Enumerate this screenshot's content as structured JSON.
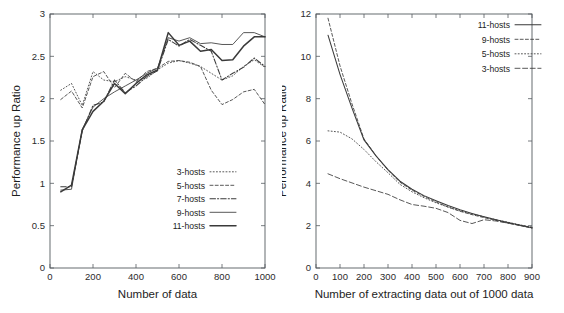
{
  "figure": {
    "panels": [
      "left",
      "right"
    ]
  },
  "chart_data": [
    {
      "id": "left",
      "type": "line",
      "title": "",
      "xlabel": "Number of data",
      "ylabel": "Performance up Ratio",
      "xlim": [
        0,
        1000
      ],
      "ylim": [
        0,
        3
      ],
      "xticks": [
        0,
        200,
        400,
        600,
        800,
        1000
      ],
      "yticks": [
        0,
        0.5,
        1,
        1.5,
        2,
        2.5,
        3
      ],
      "xticklabels": [
        "0",
        "200",
        "400",
        "600",
        "800",
        "1000"
      ],
      "yticklabels": [
        "0",
        "0.5",
        "1",
        "1.5",
        "2",
        "2.5",
        "3"
      ],
      "grid": false,
      "legend_position": "lower-right-inside",
      "x": [
        50,
        100,
        150,
        200,
        250,
        300,
        350,
        400,
        450,
        500,
        550,
        600,
        650,
        700,
        750,
        800,
        850,
        900,
        950,
        1000
      ],
      "series": [
        {
          "name": "3-hosts",
          "style": "dotted",
          "width": "thin",
          "values": [
            2.1,
            2.18,
            1.92,
            2.32,
            2.22,
            2.2,
            2.26,
            2.22,
            2.24,
            2.34,
            2.42,
            2.45,
            2.42,
            2.38,
            2.3,
            2.22,
            2.27,
            2.38,
            2.46,
            2.37
          ]
        },
        {
          "name": "5-hosts",
          "style": "dashed",
          "width": "thin",
          "values": [
            1.99,
            2.09,
            1.89,
            2.26,
            2.32,
            2.13,
            2.3,
            2.2,
            2.32,
            2.36,
            2.44,
            2.45,
            2.43,
            2.38,
            2.1,
            1.93,
            1.99,
            2.08,
            2.11,
            1.93
          ]
        },
        {
          "name": "7-hosts",
          "style": "dashdot",
          "width": "med",
          "values": [
            0.96,
            0.96,
            1.62,
            1.92,
            1.96,
            2.22,
            2.07,
            2.15,
            2.26,
            2.33,
            2.7,
            2.62,
            2.7,
            2.63,
            2.56,
            2.22,
            2.3,
            2.37,
            2.48,
            2.38
          ]
        },
        {
          "name": "9-hosts",
          "style": "solid",
          "width": "thin",
          "values": [
            0.92,
            0.93,
            1.64,
            1.9,
            2.0,
            2.08,
            2.15,
            2.22,
            2.3,
            2.36,
            2.72,
            2.68,
            2.72,
            2.65,
            2.66,
            2.64,
            2.64,
            2.78,
            2.78,
            2.73
          ]
        },
        {
          "name": "11-hosts",
          "style": "solid",
          "width": "thick",
          "values": [
            0.9,
            0.98,
            1.63,
            1.85,
            1.97,
            2.18,
            2.06,
            2.18,
            2.28,
            2.34,
            2.78,
            2.63,
            2.68,
            2.56,
            2.58,
            2.45,
            2.46,
            2.62,
            2.73,
            2.73
          ]
        }
      ]
    },
    {
      "id": "right",
      "type": "line",
      "title": "",
      "xlabel": "Number of extracting data out of 1000 data",
      "ylabel": "Performance up Ratio",
      "xlim": [
        0,
        900
      ],
      "ylim": [
        0,
        12
      ],
      "xticks": [
        0,
        100,
        200,
        300,
        400,
        500,
        600,
        700,
        800,
        900
      ],
      "yticks": [
        0,
        2,
        4,
        6,
        8,
        10,
        12
      ],
      "xticklabels": [
        "0",
        "100",
        "200",
        "300",
        "400",
        "500",
        "600",
        "700",
        "800",
        "900"
      ],
      "yticklabels": [
        "0",
        "2",
        "4",
        "6",
        "8",
        "10",
        "12"
      ],
      "grid": false,
      "legend_position": "upper-right-inside",
      "x": [
        50,
        100,
        150,
        200,
        250,
        300,
        350,
        400,
        450,
        500,
        550,
        600,
        650,
        700,
        750,
        800,
        850,
        900
      ],
      "series": [
        {
          "name": "11-hosts",
          "style": "solid",
          "width": "med",
          "values": [
            11.0,
            9.15,
            7.55,
            6.05,
            5.3,
            4.65,
            4.1,
            3.72,
            3.42,
            3.18,
            2.95,
            2.75,
            2.58,
            2.42,
            2.28,
            2.15,
            2.02,
            1.9
          ]
        },
        {
          "name": "9-hosts",
          "style": "dashed",
          "width": "thin",
          "values": [
            11.8,
            9.55,
            7.75,
            6.1,
            5.3,
            4.62,
            4.05,
            3.68,
            3.38,
            3.12,
            2.88,
            2.68,
            2.52,
            2.38,
            2.25,
            2.12,
            2.0,
            1.88
          ]
        },
        {
          "name": "5-hosts",
          "style": "dotted",
          "width": "thin",
          "values": [
            6.48,
            6.42,
            6.1,
            5.6,
            5.02,
            4.5,
            3.95,
            3.6,
            3.32,
            3.08,
            2.88,
            2.7,
            2.55,
            2.42,
            2.28,
            2.16,
            2.04,
            1.92
          ]
        },
        {
          "name": "3-hosts",
          "style": "dashed-long",
          "width": "thin",
          "values": [
            4.45,
            4.22,
            4.02,
            3.82,
            3.65,
            3.48,
            3.22,
            3.0,
            2.92,
            2.82,
            2.62,
            2.25,
            2.1,
            2.28,
            2.22,
            2.12,
            2.02,
            1.92
          ]
        }
      ]
    }
  ]
}
